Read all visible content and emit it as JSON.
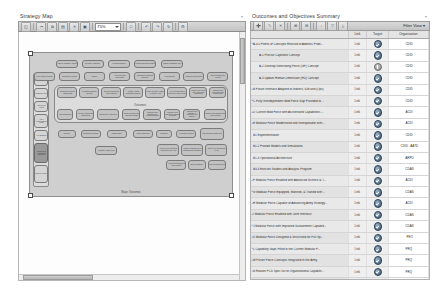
{
  "left_panel": {
    "title": "Strategy Map",
    "close_label": "×",
    "toolbar": {
      "buttons": [
        {
          "name": "select-tool",
          "glyph": "◱"
        },
        {
          "name": "cut-tool",
          "glyph": "✂"
        },
        {
          "name": "copy-tool",
          "glyph": "⧉"
        },
        {
          "name": "paste-tool",
          "glyph": "▤"
        },
        {
          "name": "delete-tool",
          "glyph": "✕"
        },
        {
          "name": "save-tool",
          "glyph": "▣"
        },
        {
          "name": "print-tool",
          "glyph": "⎙"
        }
      ],
      "zoom_value": "75%",
      "after_buttons": [
        {
          "name": "fit-page-icon",
          "glyph": "□"
        },
        {
          "name": "undo-icon",
          "glyph": "↶"
        },
        {
          "name": "redo-icon",
          "glyph": "↷"
        },
        {
          "name": "refresh-icon",
          "glyph": "↻"
        },
        {
          "name": "properties-icon",
          "glyph": "⚙"
        }
      ]
    },
    "map": {
      "caption": "Major Outcomes",
      "group_label": "Outcomes",
      "rail_nodes": [
        {
          "label": "Strategic Vision"
        },
        {
          "label": "Mission Drivers"
        },
        {
          "label": "Joint Force Focus"
        },
        {
          "label": "Force Modernization Goals"
        },
        {
          "label": "Key Enablers"
        },
        {
          "label": "Operational Readiness Objectives"
        },
        {
          "label": "Strategy Inputs"
        }
      ],
      "row1_nodes": [
        {
          "label": "Adaptive Capability Concept"
        },
        {
          "label": "Decision Advantage"
        },
        {
          "label": "Integrated Effects"
        },
        {
          "label": "Human Systems Overmatch"
        },
        {
          "label": "Mission Command Agility"
        }
      ],
      "row2_nodes": [
        {
          "label": "Force Design Concept"
        },
        {
          "label": "Sustainment Reach"
        },
        {
          "label": "Mobility"
        },
        {
          "label": "Protection and Survivability"
        },
        {
          "label": "Information Advantage Capability"
        },
        {
          "label": "Fires Network"
        },
        {
          "label": "Logistics Modernization"
        },
        {
          "label": "Talent Management System"
        }
      ],
      "outcome_row1": [
        {
          "label": "Concepts Revised to Address Risk"
        },
        {
          "label": "Precision Capstone Concept"
        },
        {
          "label": "Develop Generating Force Concept"
        },
        {
          "label": "Update Human Dimension Concept"
        },
        {
          "label": "Future Interface Adapted to Indirect Fires"
        },
        {
          "label": "Fully Interdependent Joint Force Gap Provided"
        },
        {
          "label": "Current Fleet Force with Accelerated Capabilities"
        },
        {
          "label": "Modular Force Modernized and Interoperable"
        }
      ],
      "outcome_row2": [
        {
          "label": "Experimentation"
        },
        {
          "label": "Provide Models and Simulations"
        },
        {
          "label": "Operational Architecture"
        },
        {
          "label": "Execute Studies and Analysis Program"
        },
        {
          "label": "Modular Force Enabled with Advanced Science"
        },
        {
          "label": "Modular Force Equipped, Manned & Trained"
        },
        {
          "label": "Modular Force Capable of Advancing Army Strategy"
        },
        {
          "label": "Modular Force Enabled with Joint Interface"
        }
      ],
      "row4_nodes": [
        {
          "label": "Doctrine"
        },
        {
          "label": "Organization Design"
        },
        {
          "label": "Training Base"
        },
        {
          "label": "Materiel Solutions"
        },
        {
          "label": "Leadership"
        },
        {
          "label": "Personnel Systems"
        },
        {
          "label": "Facilities and Infrastructure"
        }
      ],
      "row5_nodes": [
        {
          "label": "Capability Gaps Filled"
        },
        {
          "label": "Future Force Concepts Integrated in the Army"
        },
        {
          "label": "Realize FCS Spin Out to Organizational Capability"
        },
        {
          "label": "Realize Full Operational PACT"
        }
      ],
      "row6_nodes": [
        {
          "label": "Integrated Capabilities Development"
        },
        {
          "label": "Network Enabled"
        },
        {
          "label": "Joint Interdependence"
        }
      ]
    }
  },
  "right_panel": {
    "title": "Outcomes and Objectives Summary",
    "close_label": "×",
    "toolbar": {
      "buttons": [
        {
          "name": "new-item-icon",
          "glyph": "➕"
        },
        {
          "name": "edit-item-icon",
          "glyph": "✎"
        },
        {
          "name": "delete-item-icon",
          "glyph": "✕"
        },
        {
          "name": "expand-all-icon",
          "glyph": "⊞"
        },
        {
          "name": "collapse-all-icon",
          "glyph": "⊟"
        },
        {
          "name": "sort-icon",
          "glyph": "↓"
        },
        {
          "name": "filter-icon",
          "glyph": "▽"
        },
        {
          "name": "export-icon",
          "glyph": "⤓"
        }
      ],
      "view_button": "Filter View",
      "view_caret": "▾"
    },
    "columns": [
      "Link",
      "Target",
      "Organization"
    ],
    "rows": [
      {
        "name": "A-4.0 Points of Concepts Revised to Address Probl...",
        "indent": false,
        "expandable": true,
        "link": "Link",
        "target": "done",
        "org": "CDID"
      },
      {
        "name": "A-1 Precise Capstone Concept",
        "indent": true,
        "expandable": false,
        "link": "Link",
        "target": "done",
        "org": "CDID"
      },
      {
        "name": "A-2 Develop Generating Force (GF) Concept",
        "indent": true,
        "expandable": false,
        "link": "Link",
        "target": "pending",
        "org": "CDID"
      },
      {
        "name": "A-3 Update Human Dimension (HD) Concept",
        "indent": true,
        "expandable": false,
        "link": "Link",
        "target": "done",
        "org": "CDID"
      },
      {
        "name": "B Future Interface Adapted to Indirect, IDB and (Ops)",
        "indent": false,
        "expandable": true,
        "link": "Link",
        "target": "done",
        "org": "CDID"
      },
      {
        "name": "C Fully Interdependent Mod Force Gap Provided to ...",
        "indent": false,
        "expandable": true,
        "link": "Link",
        "target": "done",
        "org": "CDID"
      },
      {
        "name": "D Current Mod Force with Accelerated Capabilities ...",
        "indent": false,
        "expandable": true,
        "link": "Link",
        "target": "done",
        "org": "ACDI"
      },
      {
        "name": "E Modular Force Modernized and Interoperable with...",
        "indent": false,
        "expandable": true,
        "link": "Link",
        "target": "done",
        "org": "ACDI"
      },
      {
        "name": "B1 Experimentation",
        "indent": false,
        "expandable": false,
        "link": "Link",
        "target": "done",
        "org": "CDID"
      },
      {
        "name": "B1.2 Provide Models and Simulations",
        "indent": false,
        "expandable": false,
        "link": "Link",
        "target": "done",
        "org": "CDID - AATD"
      },
      {
        "name": "B1.3 Operational Architecture",
        "indent": false,
        "expandable": false,
        "link": "Link",
        "target": "done",
        "org": "ARPD"
      },
      {
        "name": "B3.4 Execute Studies and Analysis Program",
        "indent": false,
        "expandable": false,
        "link": "Link",
        "target": "done",
        "org": "CDAS"
      },
      {
        "name": "F Modular Force Enabled with Advanced Science & T...",
        "indent": false,
        "expandable": true,
        "link": "Link",
        "target": "done",
        "org": "ACDI"
      },
      {
        "name": "G Modular Force Equipped, Manned, & Trained with ...",
        "indent": false,
        "expandable": true,
        "link": "Link",
        "target": "done",
        "org": "CDAS"
      },
      {
        "name": "H Modular Force Capable of Advancing Army Strategy...",
        "indent": false,
        "expandable": true,
        "link": "Link",
        "target": "done",
        "org": "ACDI"
      },
      {
        "name": "I Modular Force Enabled with Joint Interface",
        "indent": false,
        "expandable": true,
        "link": "Link",
        "target": "done",
        "org": "CDAS"
      },
      {
        "name": "J Modular Force with Improved Sustainment Capabilit...",
        "indent": false,
        "expandable": true,
        "link": "Link",
        "target": "done",
        "org": "CDAS"
      },
      {
        "name": "K Modular Force Designed & Structured for Full Sp...",
        "indent": false,
        "expandable": true,
        "link": "Link",
        "target": "done",
        "org": "PEO"
      },
      {
        "name": "L Capability Gaps Filled in the Current Modular F...",
        "indent": false,
        "expandable": true,
        "link": "Link",
        "target": "done",
        "org": "PRQ"
      },
      {
        "name": "M Future Force Concepts Integrated in the Army",
        "indent": false,
        "expandable": true,
        "link": "Link",
        "target": "done",
        "org": "PRQ"
      },
      {
        "name": "N Realize FCS Spin Out to Organizational Capabilit...",
        "indent": false,
        "expandable": true,
        "link": "Link",
        "target": "done",
        "org": "PRQ"
      },
      {
        "name": "O Realize Full Operational PACT",
        "indent": false,
        "expandable": true,
        "link": "Link",
        "target": "done",
        "org": "PRQ"
      },
      {
        "name": "P Integrated Capabilities Development & Integration...",
        "indent": false,
        "expandable": true,
        "link": "Link",
        "target": "done",
        "org": "ARCIC-ICD"
      }
    ]
  }
}
